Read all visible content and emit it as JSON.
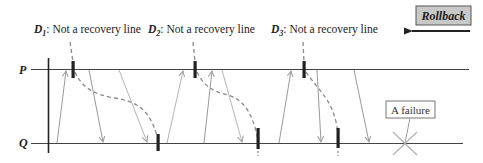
{
  "colors": {
    "line": "#444444",
    "checkpoint": "#222222",
    "message": "#9a9a9a",
    "dashed": "#8a8a8a",
    "rollback_fill": "#c8c8c8",
    "failure_box": "#777777",
    "failure_x": "#b0b0b0"
  },
  "processes": [
    {
      "name": "P",
      "y": 70
    },
    {
      "name": "Q",
      "y": 143
    }
  ],
  "cut_labels": [
    {
      "id": "D1",
      "letter": "D",
      "sub": "1",
      "text": ": Not a recovery line",
      "x": 34,
      "y": 33
    },
    {
      "id": "D2",
      "letter": "D",
      "sub": "2",
      "text": ": Not a recovery line",
      "x": 148,
      "y": 33
    },
    {
      "id": "D3",
      "letter": "D",
      "sub": "3",
      "text": ": Not a recovery line",
      "x": 271,
      "y": 33
    }
  ],
  "rollback": {
    "label": "Rollback",
    "direction": "left"
  },
  "failure": {
    "label": "A failure"
  },
  "checkpoints": {
    "P": [
      73,
      195,
      304
    ],
    "Q": [
      158,
      258,
      338
    ]
  },
  "messages": [
    {
      "from": "Q",
      "x1": 57,
      "to": "P",
      "x2": 66
    },
    {
      "from": "P",
      "x1": 89,
      "to": "Q",
      "x2": 103
    },
    {
      "from": "P",
      "x1": 119,
      "to": "Q",
      "x2": 147
    },
    {
      "from": "Q",
      "x1": 167,
      "to": "P",
      "x2": 183
    },
    {
      "from": "Q",
      "x1": 204,
      "to": "P",
      "x2": 212
    },
    {
      "from": "P",
      "x1": 222,
      "to": "Q",
      "x2": 242
    },
    {
      "from": "Q",
      "x1": 279,
      "to": "P",
      "x2": 291
    },
    {
      "from": "P",
      "x1": 317,
      "to": "Q",
      "x2": 321
    },
    {
      "from": "P",
      "x1": 354,
      "to": "Q",
      "x2": 369
    }
  ]
}
